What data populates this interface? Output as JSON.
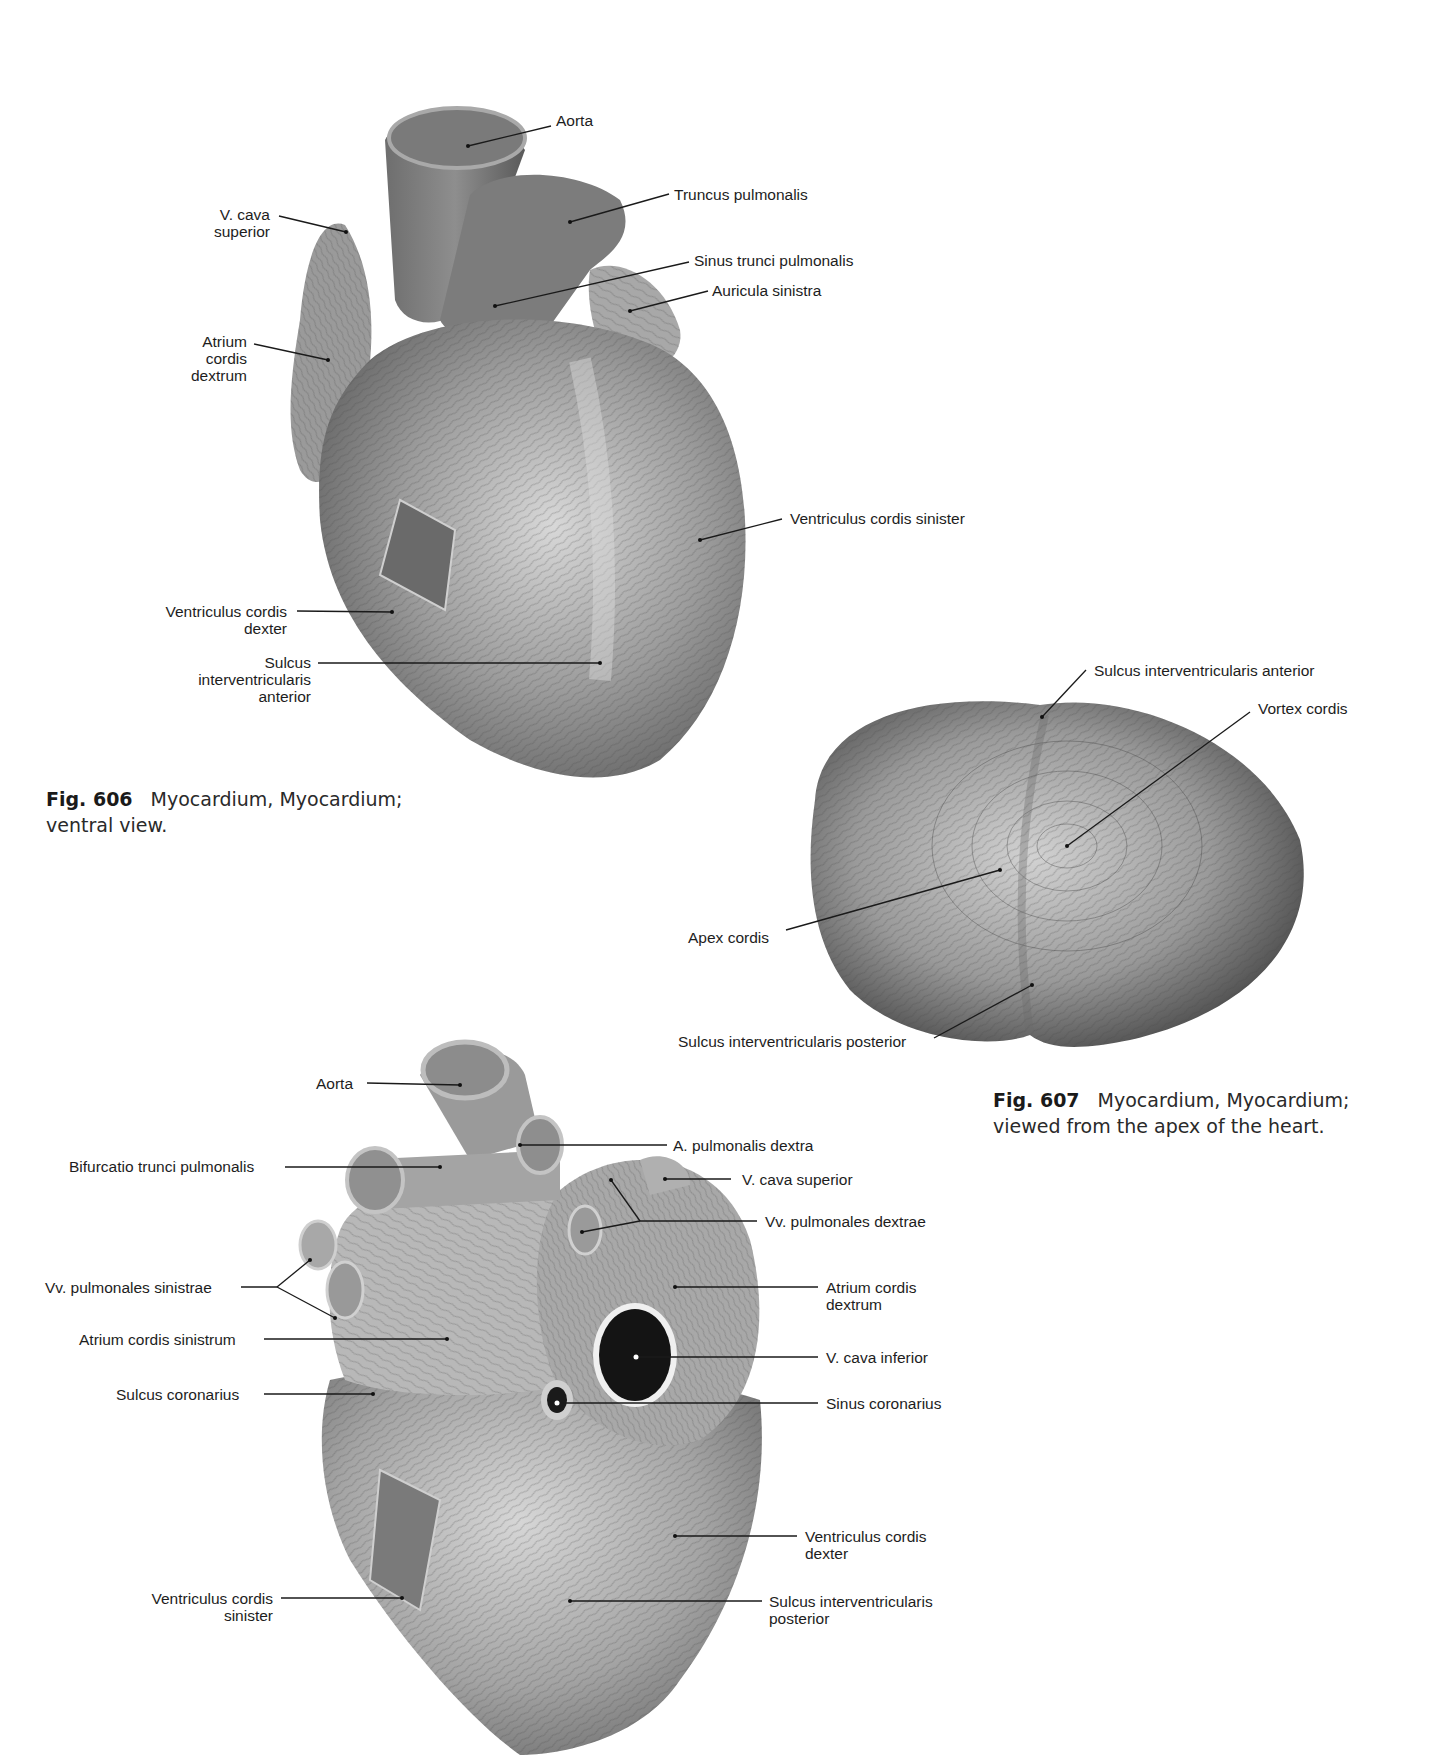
{
  "figures": [
    {
      "id": "606",
      "caption": {
        "number": "Fig. 606",
        "title": "Myocardium, Myocardium;",
        "subtitle": "ventral view."
      },
      "labels": [
        {
          "text": "Aorta"
        },
        {
          "text": "Truncus pulmonalis"
        },
        {
          "text": "Sinus trunci pulmonalis"
        },
        {
          "text": "Auricula sinistra"
        },
        {
          "text": "V. cava\nsuperior"
        },
        {
          "text": "Atrium\ncordis\ndextrum"
        },
        {
          "text": "Ventriculus cordis sinister"
        },
        {
          "text": "Ventriculus cordis\ndexter"
        },
        {
          "text": "Sulcus\ninterventricularis\nanterior"
        }
      ]
    },
    {
      "id": "607",
      "caption": {
        "number": "Fig. 607",
        "title": "Myocardium, Myocardium;",
        "subtitle": "viewed from the apex of the heart."
      },
      "labels": [
        {
          "text": "Sulcus interventricularis anterior"
        },
        {
          "text": "Vortex cordis"
        },
        {
          "text": "Apex cordis"
        },
        {
          "text": "Sulcus interventricularis posterior"
        }
      ]
    },
    {
      "id": "608",
      "labels": [
        {
          "text": "Aorta"
        },
        {
          "text": "Bifurcatio trunci pulmonalis"
        },
        {
          "text": "A. pulmonalis dextra"
        },
        {
          "text": "V. cava superior"
        },
        {
          "text": "Vv. pulmonales dextrae"
        },
        {
          "text": "Vv. pulmonales sinistrae"
        },
        {
          "text": "Atrium cordis sinistrum"
        },
        {
          "text": "Sulcus coronarius"
        },
        {
          "text": "Atrium cordis\ndextrum"
        },
        {
          "text": "V. cava inferior"
        },
        {
          "text": "Sinus coronarius"
        },
        {
          "text": "Ventriculus cordis\ndexter"
        },
        {
          "text": "Ventriculus cordis\nsinister"
        },
        {
          "text": "Sulcus interventricularis\nposterior"
        }
      ]
    }
  ]
}
